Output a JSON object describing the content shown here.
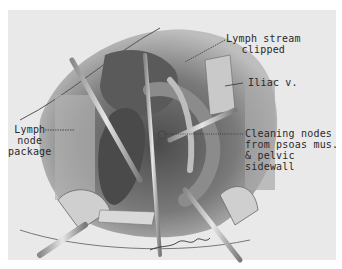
{
  "figure": {
    "type": "surgical illustration (pencil drawing)",
    "labels": {
      "lymph_stream": [
        "Lymph stream",
        "clipped"
      ],
      "iliac": [
        "Iliac v."
      ],
      "lymph_node": [
        "Lymph",
        "node",
        "package"
      ],
      "cleaning": [
        "Cleaning nodes",
        "from psoas mus.",
        "& pelvic sidewall"
      ]
    },
    "signature": "artist signature",
    "colors": {
      "background": "#ffffff",
      "plate": "#e9e9e9",
      "ink": "#2a2a2a"
    }
  }
}
